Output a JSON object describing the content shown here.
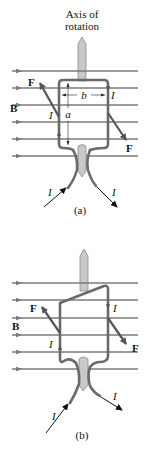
{
  "figure_a": {
    "axis_label_line1": "Axis of",
    "axis_label_line2": "rotation",
    "field_label": "B",
    "force_label_left": "F",
    "force_label_right": "F",
    "current_label_top_right": "I",
    "current_label_left": "I",
    "current_label_in": "I",
    "current_label_out": "I",
    "dimension_width": "b",
    "dimension_height": "a",
    "caption": "(a)"
  },
  "figure_b": {
    "field_label": "B",
    "force_label_left": "F",
    "force_label_right": "F",
    "current_label_right": "I",
    "current_label_left": "I",
    "current_label_in": "I",
    "current_label_out": "I",
    "caption": "(b)"
  },
  "colors": {
    "field_lines": "#7a7a7a",
    "wire": "#6a6a6a",
    "axle": "#c8c8c8",
    "force_arrow": "#555555",
    "text": "#111111"
  }
}
